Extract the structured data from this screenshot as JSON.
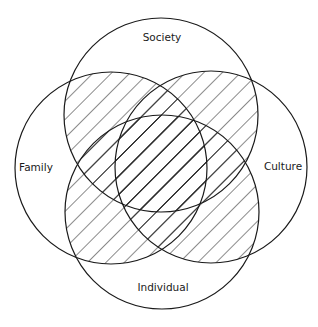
{
  "diagram": {
    "type": "venn",
    "sets": [
      {
        "key": "society",
        "label": "Society"
      },
      {
        "key": "family",
        "label": "Family"
      },
      {
        "key": "culture",
        "label": "Culture"
      },
      {
        "key": "individual",
        "label": "Individual"
      }
    ],
    "hatched_regions": "all overlaps of two or more sets",
    "colors": {
      "stroke": "#1a1a1a",
      "hatch": "#2a2a2a",
      "background": "#ffffff"
    }
  }
}
